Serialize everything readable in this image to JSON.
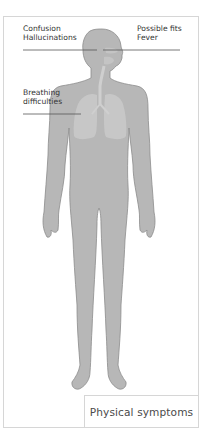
{
  "labels": {
    "head_left": {
      "line1": "Confusion",
      "line2": "Hallucinations"
    },
    "head_right": {
      "line1": "Possible fits",
      "line2": "Fever"
    },
    "chest_left": {
      "line1": "Breathing",
      "line2": "difficulties"
    }
  },
  "caption": "Physical symptoms",
  "colors": {
    "body_fill": "#b7b7b7",
    "body_outline": "#8c8c8c",
    "lungs": "#c9c9c9",
    "leader_line": "#555555",
    "frame": "#d6d6d6",
    "text": "#333333"
  },
  "icons": {
    "figure": "human-body-figure",
    "lungs": "lungs-icon",
    "airway": "trachea-icon"
  }
}
